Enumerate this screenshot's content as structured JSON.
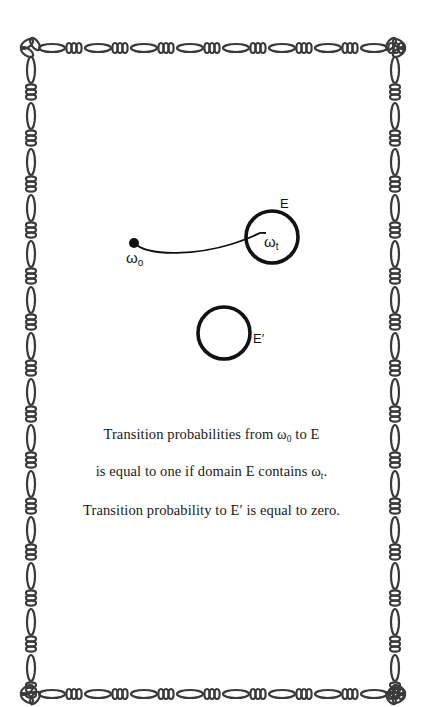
{
  "diagram": {
    "border": {
      "style": "figaro-chain",
      "color": "#3a3a3a"
    },
    "start_point": {
      "symbol": "ω",
      "subscript": "o"
    },
    "end_point": {
      "symbol": "ω",
      "subscript": "t"
    },
    "domain_E": {
      "label": "E"
    },
    "domain_E_prime": {
      "label": "E′"
    },
    "stroke_color": "#111111"
  },
  "caption": {
    "line1": {
      "prefix": "Transition probabilities from ω",
      "sub": "0",
      "suffix": " to E"
    },
    "line2": {
      "prefix": "is equal to one if domain E contains ω",
      "sub": "t",
      "suffix": "."
    },
    "line3": {
      "text": "Transition probability to E′ is equal to zero."
    }
  }
}
